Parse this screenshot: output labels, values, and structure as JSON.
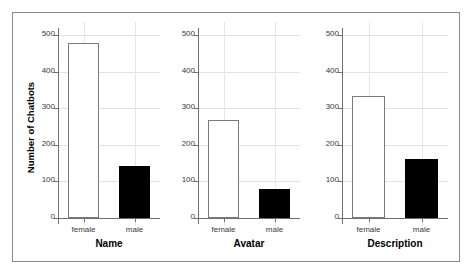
{
  "chart_data": {
    "type": "bar",
    "title": "",
    "xlabel": "",
    "ylabel": "Number of Chatbots",
    "ylim": [
      0,
      520
    ],
    "yticks": [
      0,
      100,
      200,
      300,
      400,
      500
    ],
    "ytick_labels": [
      "0",
      "100",
      "200",
      "300",
      "400",
      "500"
    ],
    "grid": true,
    "legend": "none",
    "categories": [
      "female",
      "male"
    ],
    "panels": [
      {
        "title": "Name",
        "categories": [
          "female",
          "male"
        ],
        "values": [
          478,
          142
        ],
        "styles": [
          "open",
          "filled"
        ]
      },
      {
        "title": "Avatar",
        "categories": [
          "female",
          "male"
        ],
        "values": [
          268,
          80
        ],
        "styles": [
          "open",
          "filled"
        ]
      },
      {
        "title": "Description",
        "categories": [
          "female",
          "male"
        ],
        "values": [
          334,
          161
        ],
        "styles": [
          "open",
          "filled"
        ]
      }
    ],
    "colors": {
      "female_bar": "#ffffff",
      "female_bar_edge": "#7a7a7a",
      "male_bar": "#000000",
      "axis": "#6f6f6f",
      "grid": "#e2e2e2",
      "frame": "#8a8a8a",
      "text": "#000000",
      "background": "#ffffff"
    }
  }
}
